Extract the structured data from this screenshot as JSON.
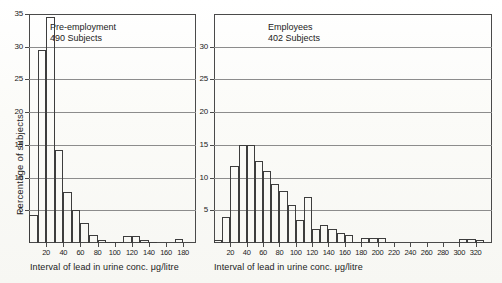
{
  "figure": {
    "ylabel": "Percentage of subjects",
    "xlabel": "Interval of lead in urine conc. μg/litre",
    "background_color": "#fdfdfb",
    "line_color": "#3d3d3d",
    "grid_color": "#8c8c8c"
  },
  "chart_data": [
    {
      "type": "bar",
      "title": "Pre-employment",
      "subtitle": "490 Subjects",
      "xlabel": "Interval of lead in urine conc. μg/litre",
      "ylabel": "Percentage of subjects",
      "ylim": [
        0,
        35
      ],
      "xlim": [
        0,
        195
      ],
      "grid": true,
      "ytick_labels": [
        "5",
        "10",
        "15",
        "20",
        "25",
        "30",
        "35"
      ],
      "ytick_values": [
        5,
        10,
        15,
        20,
        25,
        30,
        35
      ],
      "xtick_labels": [
        "20",
        "40",
        "60",
        "80",
        "100",
        "120",
        "140",
        "160",
        "180"
      ],
      "xtick_values": [
        20,
        40,
        60,
        80,
        100,
        120,
        140,
        160,
        180
      ],
      "bin_width": 10,
      "bin_starts": [
        0,
        10,
        20,
        30,
        40,
        50,
        60,
        70,
        80,
        90,
        100,
        110,
        120,
        130,
        140,
        150,
        160,
        170,
        180
      ],
      "categories": [
        "0-10",
        "10-20",
        "20-30",
        "30-40",
        "40-50",
        "50-60",
        "60-70",
        "70-80",
        "80-90",
        "90-100",
        "100-110",
        "110-120",
        "120-130",
        "130-140",
        "140-150",
        "150-160",
        "160-170",
        "170-180",
        "180-190"
      ],
      "values": [
        4.3,
        29.5,
        34.5,
        14.2,
        7.8,
        5.0,
        3.0,
        1.2,
        0.5,
        0.2,
        0.2,
        1.0,
        1.0,
        0.5,
        0.1,
        0.0,
        0.0,
        0.6,
        0.0
      ]
    },
    {
      "type": "bar",
      "title": "Employees",
      "subtitle": "402 Subjects",
      "xlabel": "Interval of lead in urine conc. μg/litre",
      "ylabel": "Percentage of subjects",
      "ylim": [
        0,
        35
      ],
      "xlim": [
        0,
        340
      ],
      "grid": true,
      "ytick_labels": [
        "5",
        "10",
        "15",
        "20",
        "25",
        "30"
      ],
      "ytick_values": [
        5,
        10,
        15,
        20,
        25,
        30
      ],
      "xtick_labels": [
        "20",
        "40",
        "60",
        "80",
        "100",
        "120",
        "140",
        "160",
        "180",
        "200",
        "220",
        "240",
        "260",
        "280",
        "300",
        "320"
      ],
      "xtick_values": [
        20,
        40,
        60,
        80,
        100,
        120,
        140,
        160,
        180,
        200,
        220,
        240,
        260,
        280,
        300,
        320
      ],
      "bin_width": 10,
      "bin_starts": [
        0,
        10,
        20,
        30,
        40,
        50,
        60,
        70,
        80,
        90,
        100,
        110,
        120,
        130,
        140,
        150,
        160,
        170,
        180,
        190,
        200,
        210,
        220,
        230,
        240,
        250,
        260,
        270,
        280,
        290,
        300,
        310,
        320,
        330
      ],
      "categories": [
        "0-10",
        "10-20",
        "20-30",
        "30-40",
        "40-50",
        "50-60",
        "60-70",
        "70-80",
        "80-90",
        "90-100",
        "100-110",
        "110-120",
        "120-130",
        "130-140",
        "140-150",
        "150-160",
        "160-170",
        "170-180",
        "180-190",
        "190-200",
        "200-210",
        "210-220",
        "220-230",
        "230-240",
        "240-250",
        "250-260",
        "260-270",
        "270-280",
        "280-290",
        "290-300",
        "300-310",
        "310-320",
        "320-330",
        "330-340"
      ],
      "values": [
        0.5,
        4.0,
        11.8,
        15.0,
        15.0,
        12.5,
        11.0,
        9.0,
        8.0,
        5.8,
        3.5,
        7.0,
        2.2,
        2.8,
        2.2,
        1.6,
        1.2,
        0.2,
        0.8,
        0.8,
        0.8,
        0.1,
        0.0,
        0.0,
        0.0,
        0.0,
        0.0,
        0.0,
        0.0,
        0.0,
        0.6,
        0.6,
        0.5,
        0.0
      ]
    }
  ]
}
